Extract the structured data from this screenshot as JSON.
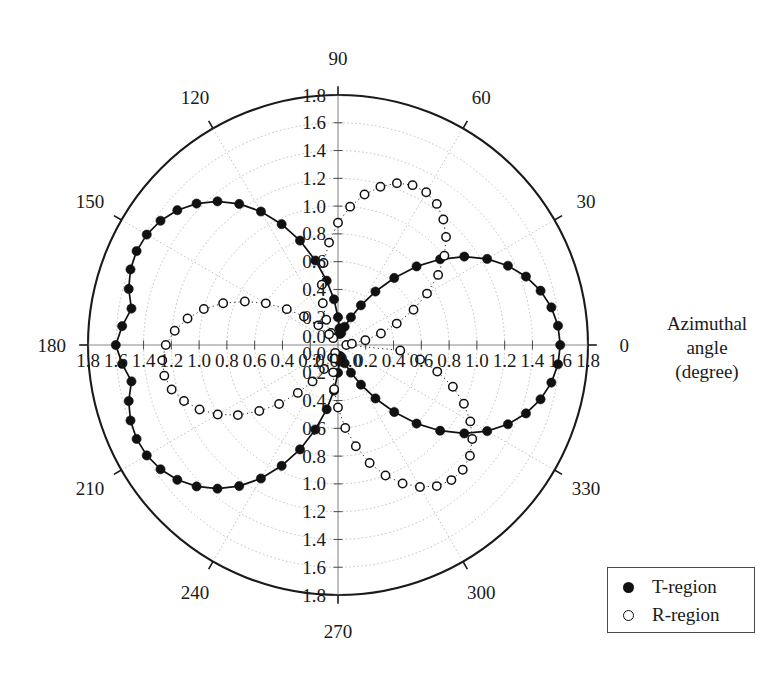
{
  "figure": {
    "axis_caption_lines": [
      "Azimuthal",
      "angle",
      "(degree)"
    ],
    "axis_caption": "Azimuthal angle (degree)"
  },
  "legend": {
    "position": "bottom-right",
    "entries": [
      {
        "label": "T-region",
        "marker": "filled-circle",
        "color": "#111111"
      },
      {
        "label": "R-region",
        "marker": "open-circle",
        "color": "#111111"
      }
    ]
  },
  "chart_data": {
    "type": "line",
    "projection": "polar",
    "title": "",
    "xlabel": "Azimuthal angle (degree)",
    "ylabel": "",
    "grid": true,
    "rlim": [
      0.0,
      1.8
    ],
    "r_ticks": [
      0.0,
      0.2,
      0.4,
      0.6,
      0.8,
      1.0,
      1.2,
      1.4,
      1.6,
      1.8
    ],
    "r_tick_labels": [
      "0.0",
      "0.2",
      "0.4",
      "0.6",
      "0.8",
      "1.0",
      "1.2",
      "1.4",
      "1.6",
      "1.8"
    ],
    "r_tick_labels_left": [
      "1.8",
      "1.6",
      "1.4",
      "1.2",
      "1.0",
      "0.8",
      "0.6",
      "0.4",
      "0.2",
      "0.0"
    ],
    "r_tick_labels_right": [
      "0.0",
      "0.2",
      "0.4",
      "0.6",
      "0.8",
      "1.0",
      "1.2",
      "1.4",
      "1.6",
      "1.8"
    ],
    "r_tick_labels_up": [
      "1.8",
      "1.6",
      "1.4",
      "1.2",
      "1.0",
      "0.8",
      "0.6",
      "0.4",
      "0.2",
      "0.0"
    ],
    "r_tick_labels_down": [
      "0.0",
      "0.2",
      "0.4",
      "0.6",
      "0.8",
      "1.0",
      "1.2",
      "1.4",
      "1.6",
      "1.8"
    ],
    "theta_ticks": [
      0,
      30,
      60,
      90,
      120,
      150,
      180,
      210,
      240,
      270,
      300,
      330
    ],
    "theta_tick_labels": [
      "0",
      "30",
      "60",
      "90",
      "120",
      "150",
      "180",
      "210",
      "240",
      "270",
      "300",
      "330"
    ],
    "theta_direction": "counterclockwise",
    "theta_zero_location": "E",
    "series": [
      {
        "name": "T-region",
        "marker": "filled-circle",
        "line": "solid",
        "color": "#111111",
        "theta": [
          0,
          5,
          10,
          15,
          20,
          25,
          30,
          35,
          40,
          45,
          50,
          55,
          60,
          65,
          70,
          75,
          80,
          85,
          90,
          95,
          100,
          105,
          110,
          115,
          120,
          125,
          130,
          135,
          140,
          145,
          150,
          155,
          160,
          165,
          170,
          175,
          180,
          185,
          190,
          195,
          200,
          205,
          210,
          215,
          220,
          225,
          230,
          235,
          240,
          245,
          250,
          255,
          260,
          265,
          270,
          275,
          280,
          285,
          290,
          295,
          300,
          305,
          310,
          315,
          320,
          325,
          330,
          335,
          340,
          345,
          350,
          355
        ],
        "r": [
          1.6,
          1.59,
          1.56,
          1.51,
          1.44,
          1.35,
          1.24,
          1.11,
          0.96,
          0.8,
          0.63,
          0.47,
          0.33,
          0.22,
          0.14,
          0.09,
          0.08,
          0.12,
          0.2,
          0.33,
          0.47,
          0.63,
          0.8,
          0.96,
          1.11,
          1.24,
          1.35,
          1.44,
          1.51,
          1.56,
          1.59,
          1.6,
          1.59,
          1.56,
          1.51,
          1.56,
          1.6,
          1.56,
          1.51,
          1.56,
          1.59,
          1.6,
          1.59,
          1.56,
          1.51,
          1.44,
          1.35,
          1.24,
          1.11,
          0.96,
          0.8,
          0.63,
          0.47,
          0.33,
          0.2,
          0.12,
          0.08,
          0.09,
          0.14,
          0.22,
          0.33,
          0.47,
          0.63,
          0.8,
          0.96,
          1.11,
          1.24,
          1.35,
          1.44,
          1.51,
          1.56,
          1.59
        ]
      },
      {
        "name": "R-region",
        "marker": "open-circle",
        "line": "dotted",
        "color": "#111111",
        "theta": [
          0,
          5,
          10,
          15,
          20,
          25,
          30,
          35,
          40,
          45,
          50,
          55,
          60,
          65,
          70,
          75,
          80,
          85,
          90,
          95,
          100,
          105,
          110,
          115,
          120,
          125,
          130,
          135,
          140,
          145,
          150,
          155,
          160,
          165,
          170,
          175,
          180,
          185,
          190,
          195,
          200,
          205,
          210,
          215,
          220,
          225,
          230,
          235,
          240,
          245,
          250,
          255,
          260,
          265,
          270,
          275,
          280,
          285,
          290,
          295,
          300,
          305,
          310,
          315,
          320,
          325,
          330,
          335,
          340,
          345,
          350,
          355
        ],
        "r": [
          0.06,
          0.1,
          0.2,
          0.32,
          0.45,
          0.6,
          0.74,
          0.88,
          1.0,
          1.1,
          1.18,
          1.24,
          1.27,
          1.27,
          1.24,
          1.18,
          1.1,
          1.0,
          0.88,
          0.74,
          0.6,
          0.45,
          0.32,
          0.2,
          0.1,
          0.06,
          0.1,
          0.2,
          0.32,
          0.45,
          0.6,
          0.74,
          0.88,
          1.0,
          1.1,
          1.18,
          1.24,
          1.27,
          1.27,
          1.24,
          1.18,
          1.1,
          1.0,
          0.88,
          0.74,
          0.6,
          0.45,
          0.32,
          0.2,
          0.1,
          0.06,
          0.1,
          0.2,
          0.32,
          0.45,
          0.6,
          0.74,
          0.88,
          1.0,
          1.1,
          1.18,
          1.24,
          1.27,
          1.27,
          1.24,
          1.18,
          1.1,
          1.0,
          0.88,
          0.74,
          0.6,
          0.45
        ]
      }
    ],
    "geometry": {
      "center_x": 338,
      "center_y": 345,
      "radius_px": 250,
      "r_max": 1.8
    }
  }
}
